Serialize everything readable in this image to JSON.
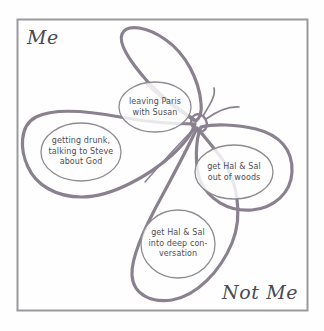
{
  "figure": {
    "title_label_top_left": "Me",
    "title_label_bottom_right": "Not Me",
    "stroke_color": "#8a8190",
    "bubble_stroke_color": "#8c8c92",
    "frame_color": "#9a9a9e",
    "text_color": "#4d4d55",
    "background_color": "#fefefe"
  },
  "bubbles": [
    {
      "id": "leaving-paris",
      "text": "leaving Paris\nwith Susan",
      "cx": 155,
      "cy": 107,
      "rx": 36,
      "ry": 25
    },
    {
      "id": "getting-drunk",
      "text": "getting drunk,\ntalking to Steve\nabout God",
      "cx": 81,
      "cy": 152,
      "rx": 40,
      "ry": 29
    },
    {
      "id": "hal-sal-woods",
      "text": "get Hal & Sal\nout of woods",
      "cx": 234,
      "cy": 172,
      "rx": 39,
      "ry": 27
    },
    {
      "id": "hal-sal-conversation",
      "text": "get Hal & Sal\nthe deep con-\nversation",
      "cx": 178,
      "cy": 244,
      "rx": 37,
      "ry": 34
    }
  ],
  "bubble_text_overrides": {
    "hal-sal-conversation": "get Hal & Sal\ninto deep con-\nversation"
  }
}
